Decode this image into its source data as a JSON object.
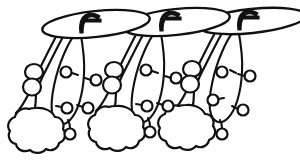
{
  "figure": {
    "title": "Line drawing of three repeating stalked structures",
    "style": "black-and-white ink line drawing",
    "background_color": "#ffffff",
    "ink_color": "#111111",
    "canvas": {
      "width": 300,
      "height": 160
    },
    "unit_count": 3,
    "units": [
      {
        "name": "unit-left",
        "cap": {
          "name": "elliptical-cap",
          "cx": 96,
          "cy": 24,
          "rx": 54,
          "ry": 13,
          "rotation": -6
        },
        "hook": {
          "name": "cap-hook-mark",
          "x": 82,
          "y": 14
        },
        "stalks": [
          {
            "name": "stalk-outer-left",
            "top_x": 58,
            "top_y": 33,
            "bottom_x": 32,
            "bottom_y": 73
          },
          {
            "name": "stalk-inner-left",
            "top_x": 82,
            "top_y": 30,
            "bottom_x": 62,
            "bottom_y": 78
          }
        ],
        "bead_chain": {
          "name": "bead-chain-left",
          "beads": [
            {
              "cx": 34,
              "cy": 72,
              "rx": 8,
              "ry": 7
            },
            {
              "cx": 32,
              "cy": 86,
              "rx": 8,
              "ry": 8
            }
          ]
        },
        "blob": {
          "name": "lobed-blob-left",
          "cx": 35,
          "cy": 128,
          "r": 22,
          "lobes": 13
        },
        "loop": {
          "name": "tapered-loop-left",
          "top_x": 80,
          "top_y": 30,
          "bottom_x": 72,
          "bottom_y": 120,
          "width": 16
        },
        "small_circles": [
          {
            "name": "small-circle",
            "cx": 66,
            "cy": 72,
            "r": 5
          },
          {
            "name": "small-circle",
            "cx": 96,
            "cy": 80,
            "r": 5
          },
          {
            "name": "small-circle",
            "cx": 67,
            "cy": 108,
            "r": 5
          },
          {
            "name": "small-circle",
            "cx": 88,
            "cy": 108,
            "r": 5
          },
          {
            "name": "small-circle",
            "cx": 70,
            "cy": 134,
            "r": 5
          }
        ]
      },
      {
        "name": "unit-middle",
        "cap": {
          "name": "elliptical-cap",
          "cx": 176,
          "cy": 22,
          "rx": 54,
          "ry": 13,
          "rotation": -6
        },
        "hook": {
          "name": "cap-hook-mark",
          "x": 162,
          "y": 12
        },
        "stalks": [
          {
            "name": "stalk-outer-middle",
            "top_x": 138,
            "top_y": 31,
            "bottom_x": 112,
            "bottom_y": 71
          },
          {
            "name": "stalk-inner-middle",
            "top_x": 162,
            "top_y": 28,
            "bottom_x": 142,
            "bottom_y": 76
          }
        ],
        "bead_chain": {
          "name": "bead-chain-middle",
          "beads": [
            {
              "cx": 114,
              "cy": 70,
              "rx": 8,
              "ry": 7
            },
            {
              "cx": 112,
              "cy": 84,
              "rx": 8,
              "ry": 8
            }
          ]
        },
        "blob": {
          "name": "lobed-blob-middle",
          "cx": 116,
          "cy": 126,
          "r": 22,
          "lobes": 13
        },
        "loop": {
          "name": "tapered-loop-middle",
          "top_x": 160,
          "top_y": 28,
          "bottom_x": 152,
          "bottom_y": 118,
          "width": 16
        },
        "small_circles": [
          {
            "name": "small-circle",
            "cx": 146,
            "cy": 70,
            "r": 5
          },
          {
            "name": "small-circle",
            "cx": 176,
            "cy": 78,
            "r": 5
          },
          {
            "name": "small-circle",
            "cx": 147,
            "cy": 106,
            "r": 5
          },
          {
            "name": "small-circle",
            "cx": 168,
            "cy": 106,
            "r": 5
          },
          {
            "name": "small-circle",
            "cx": 150,
            "cy": 132,
            "r": 5
          }
        ]
      },
      {
        "name": "unit-right",
        "cap": {
          "name": "elliptical-cap",
          "cx": 252,
          "cy": 21,
          "rx": 54,
          "ry": 12,
          "rotation": -6
        },
        "hook": {
          "name": "cap-hook-mark",
          "x": 240,
          "y": 11
        },
        "stalks": [
          {
            "name": "stalk-outer-right",
            "top_x": 216,
            "top_y": 30,
            "bottom_x": 190,
            "bottom_y": 70
          },
          {
            "name": "stalk-inner-right",
            "top_x": 240,
            "top_y": 27,
            "bottom_x": 220,
            "bottom_y": 75
          }
        ],
        "bead_chain": {
          "name": "bead-chain-right",
          "beads": [
            {
              "cx": 192,
              "cy": 69,
              "rx": 8,
              "ry": 7
            },
            {
              "cx": 190,
              "cy": 83,
              "rx": 8,
              "ry": 8
            }
          ]
        },
        "blob": {
          "name": "lobed-blob-right",
          "cx": 186,
          "cy": 125,
          "r": 21,
          "lobes": 13
        },
        "loop": {
          "name": "tapered-loop-right",
          "top_x": 238,
          "top_y": 27,
          "bottom_x": 228,
          "bottom_y": 117,
          "width": 17
        },
        "small_circles": [
          {
            "name": "small-circle",
            "cx": 222,
            "cy": 72,
            "r": 5
          },
          {
            "name": "small-circle",
            "cx": 250,
            "cy": 76,
            "r": 5
          },
          {
            "name": "small-circle",
            "cx": 213,
            "cy": 100,
            "r": 5
          },
          {
            "name": "small-circle",
            "cx": 243,
            "cy": 110,
            "r": 5
          },
          {
            "name": "small-circle",
            "cx": 222,
            "cy": 134,
            "r": 5
          }
        ]
      }
    ]
  }
}
